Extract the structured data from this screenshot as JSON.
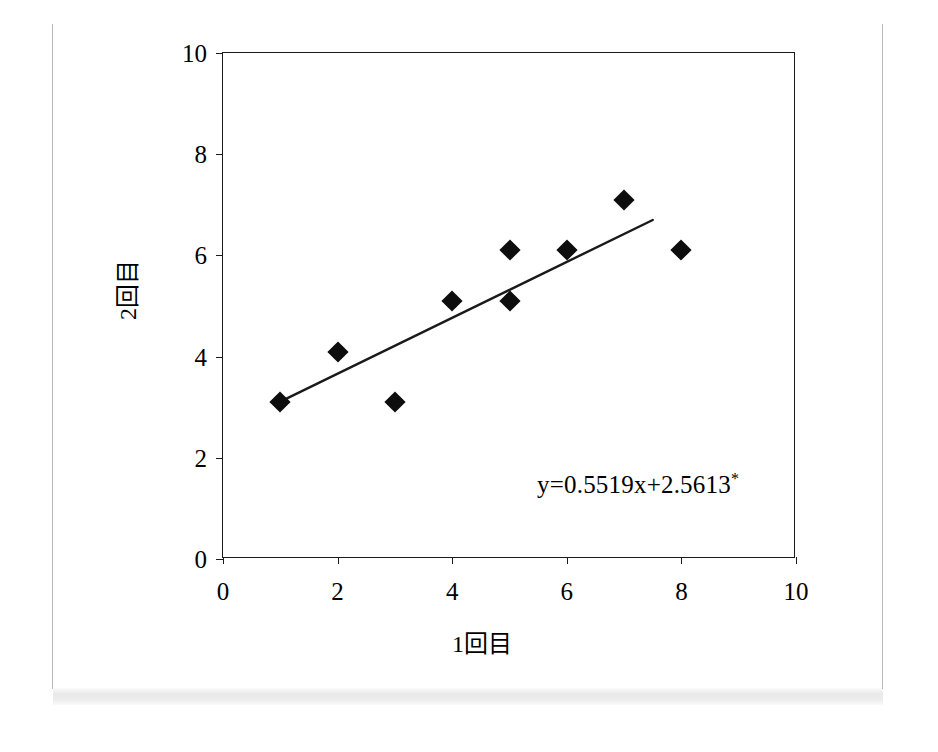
{
  "figure": {
    "axis_title_x": "1回目",
    "axis_title_y": "2回目",
    "annotation": "y=0.5519x+2.5613",
    "annotation_star": "*"
  },
  "chart_data": {
    "type": "scatter",
    "title": "",
    "xlabel": "1回目",
    "ylabel": "2回目",
    "xlim": [
      0,
      10
    ],
    "ylim": [
      0,
      10
    ],
    "xticks": [
      0,
      2,
      4,
      6,
      8,
      10
    ],
    "yticks": [
      0,
      2,
      4,
      6,
      8,
      10
    ],
    "xtick_labels": [
      "0",
      "2",
      "4",
      "6",
      "8",
      "10"
    ],
    "ytick_labels": [
      "0",
      "2",
      "4",
      "6",
      "8",
      "10"
    ],
    "grid": false,
    "legend": null,
    "marker": "diamond",
    "marker_color": "#0d0d0d",
    "points": [
      {
        "x": 1,
        "y": 3.1
      },
      {
        "x": 2,
        "y": 4.1
      },
      {
        "x": 3,
        "y": 3.1
      },
      {
        "x": 4,
        "y": 5.1
      },
      {
        "x": 5,
        "y": 6.1
      },
      {
        "x": 5,
        "y": 5.1
      },
      {
        "x": 6,
        "y": 6.1
      },
      {
        "x": 7,
        "y": 7.1
      },
      {
        "x": 8,
        "y": 6.1
      }
    ],
    "series": [
      {
        "name": "observations",
        "x": [
          1,
          2,
          3,
          4,
          5,
          5,
          6,
          7,
          8
        ],
        "values": [
          3.1,
          4.1,
          3.1,
          5.1,
          6.1,
          5.1,
          6.1,
          7.1,
          6.1
        ]
      }
    ],
    "trendline": {
      "type": "linear",
      "slope": 0.5519,
      "intercept": 2.5613,
      "equation": "y=0.5519x+2.5613*",
      "x_start": 1.0,
      "x_end": 7.5,
      "y_start": 3.11,
      "y_end": 6.7,
      "color": "#1a1a1a"
    },
    "annotations": [
      {
        "text": "y=0.5519x+2.5613*",
        "x": 5.5,
        "y": 1.7
      }
    ]
  }
}
